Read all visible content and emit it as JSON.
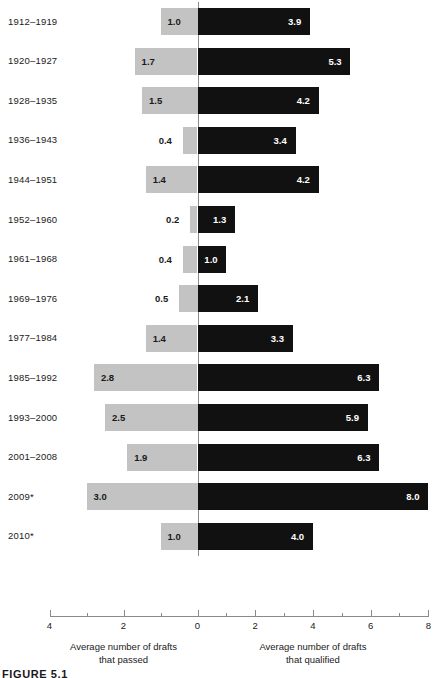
{
  "chart_data": {
    "type": "bar",
    "subtype": "diverging-horizontal-bar",
    "title": "",
    "categories": [
      "1912–1919",
      "1920–1927",
      "1928–1935",
      "1936–1943",
      "1944–1951",
      "1952–1960",
      "1961–1968",
      "1969–1976",
      "1977–1984",
      "1985–1992",
      "1993–2000",
      "2001–2008",
      "2009*",
      "2010*"
    ],
    "series": [
      {
        "name": "Average number of drafts that passed",
        "direction": "left",
        "color": "#c3c3c3",
        "values": [
          1.0,
          1.7,
          1.5,
          0.4,
          1.4,
          0.2,
          0.4,
          0.5,
          1.4,
          2.8,
          2.5,
          1.9,
          3.0,
          1.0
        ],
        "labels": [
          "1.0",
          "1.7",
          "1.5",
          "0.4",
          "1.4",
          "0.2",
          "0.4",
          "0.5",
          "1.4",
          "2.8",
          "2.5",
          "1.9",
          "3.0",
          "1.0"
        ]
      },
      {
        "name": "Average number of drafts that qualified",
        "direction": "right",
        "color": "#111111",
        "values": [
          3.9,
          5.3,
          4.2,
          3.4,
          4.2,
          1.3,
          1.0,
          2.1,
          3.3,
          6.3,
          5.9,
          6.3,
          8.0,
          4.0
        ],
        "labels": [
          "3.9",
          "5.3",
          "4.2",
          "3.4",
          "4.2",
          "1.3",
          "1.0",
          "2.1",
          "3.3",
          "6.3",
          "5.9",
          "6.3",
          "8.0",
          "4.0"
        ]
      }
    ],
    "xlabel_left": "Average number of drafts\nthat passed",
    "xlabel_right": "Average number of drafts\nthat qualified",
    "ylabel": "",
    "grid": false,
    "legend": "none",
    "axis": {
      "left_max": 4,
      "right_max": 8,
      "left_ticks": [
        4,
        2,
        0
      ],
      "right_ticks": [
        0,
        2,
        4,
        6,
        8
      ],
      "left_tick_labels": [
        "4",
        "2",
        "0"
      ],
      "right_tick_labels": [
        "0",
        "2",
        "4",
        "6",
        "8"
      ],
      "minor_tick_step_left": 1,
      "minor_tick_step_right": 1
    }
  },
  "axis_titles": {
    "left_line1": "Average number of drafts",
    "left_line2": "that passed",
    "right_line1": "Average number of drafts",
    "right_line2": "that qualified"
  },
  "caption": {
    "text": "FIGURE 5.1"
  },
  "colors": {
    "left_bar": "#c3c3c3",
    "right_bar": "#111111",
    "axis": "#8a8a8a",
    "text": "#1a1a1a",
    "value_label_on_dark": "#ffffff",
    "background": "#ffffff"
  }
}
